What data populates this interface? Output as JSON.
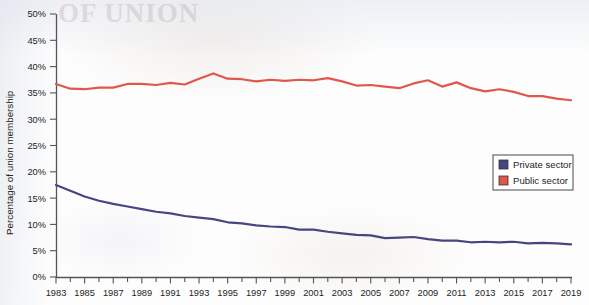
{
  "chart_data": {
    "type": "line",
    "title": "",
    "xlabel": "",
    "ylabel": "Percentage of union membership",
    "ylim": [
      0,
      50
    ],
    "xlim": [
      1983,
      2019
    ],
    "ytick_labels": [
      "0%",
      "5%",
      "10%",
      "15%",
      "20%",
      "25%",
      "30%",
      "35%",
      "40%",
      "45%",
      "50%"
    ],
    "ytick_values": [
      0,
      5,
      10,
      15,
      20,
      25,
      30,
      35,
      40,
      45,
      50
    ],
    "xtick_labels": [
      "1983",
      "1985",
      "1987",
      "1989",
      "1991",
      "1993",
      "1995",
      "1997",
      "1999",
      "2001",
      "2003",
      "2005",
      "2007",
      "2009",
      "2011",
      "2013",
      "2015",
      "2017",
      "2019"
    ],
    "xtick_values": [
      1983,
      1985,
      1987,
      1989,
      1991,
      1993,
      1995,
      1997,
      1999,
      2001,
      2003,
      2005,
      2007,
      2009,
      2011,
      2013,
      2015,
      2017,
      2019
    ],
    "minor_xticks_every": 1,
    "grid": false,
    "legend_position": "center-right",
    "x": [
      1983,
      1984,
      1985,
      1986,
      1987,
      1988,
      1989,
      1990,
      1991,
      1992,
      1993,
      1994,
      1995,
      1996,
      1997,
      1998,
      1999,
      2000,
      2001,
      2002,
      2003,
      2004,
      2005,
      2006,
      2007,
      2008,
      2009,
      2010,
      2011,
      2012,
      2013,
      2014,
      2015,
      2016,
      2017,
      2018,
      2019
    ],
    "series": [
      {
        "name": "Private sector",
        "color": "#464683",
        "values": [
          17.5,
          16.4,
          15.3,
          14.5,
          13.9,
          13.4,
          12.9,
          12.4,
          12.1,
          11.6,
          11.3,
          11.0,
          10.4,
          10.2,
          9.8,
          9.6,
          9.5,
          9.0,
          9.0,
          8.6,
          8.3,
          8.0,
          7.9,
          7.4,
          7.5,
          7.6,
          7.2,
          6.9,
          6.9,
          6.6,
          6.7,
          6.6,
          6.7,
          6.4,
          6.5,
          6.4,
          6.2
        ]
      },
      {
        "name": "Public sector",
        "color": "#e0574b",
        "values": [
          36.7,
          35.8,
          35.7,
          36.0,
          36.0,
          36.7,
          36.7,
          36.5,
          36.9,
          36.6,
          37.7,
          38.7,
          37.7,
          37.6,
          37.2,
          37.5,
          37.3,
          37.5,
          37.4,
          37.8,
          37.2,
          36.4,
          36.5,
          36.2,
          35.9,
          36.8,
          37.4,
          36.2,
          37.0,
          35.9,
          35.3,
          35.7,
          35.2,
          34.4,
          34.4,
          33.9,
          33.6
        ]
      }
    ]
  },
  "legend": {
    "items": [
      {
        "label": "Private sector",
        "swatch_color": "#464683"
      },
      {
        "label": "Public sector",
        "swatch_color": "#e0574b"
      }
    ]
  },
  "axis": {
    "y_title": "Percentage of union membership"
  },
  "background": {
    "ghost_text": "OF UNION"
  }
}
